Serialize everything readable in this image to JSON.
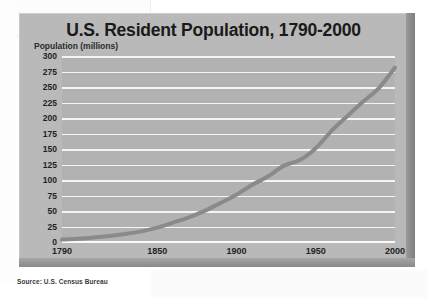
{
  "source_note": "Source: U.S. Census Bureau",
  "chart_data": {
    "type": "line",
    "title": "U.S. Resident Population, 1790-2000",
    "xlabel": "",
    "ylabel": "Population (millions)",
    "xlim": [
      1790,
      2000
    ],
    "ylim": [
      0,
      300
    ],
    "grid": true,
    "legend": "none",
    "xticks": [
      "1790",
      "1850",
      "1900",
      "1950",
      "2000"
    ],
    "xtick_values": [
      1790,
      1850,
      1900,
      1950,
      2000
    ],
    "yticks": [
      "300",
      "275",
      "250",
      "225",
      "200",
      "175",
      "150",
      "125",
      "100",
      "75",
      "50",
      "25",
      "0"
    ],
    "ytick_values": [
      300,
      275,
      250,
      225,
      200,
      175,
      150,
      125,
      100,
      75,
      50,
      25,
      0
    ],
    "x": [
      1790,
      1800,
      1810,
      1820,
      1830,
      1840,
      1850,
      1860,
      1870,
      1880,
      1890,
      1900,
      1910,
      1920,
      1930,
      1940,
      1950,
      1960,
      1970,
      1980,
      1990,
      2000
    ],
    "values": [
      3.9,
      5.3,
      7.2,
      9.6,
      12.9,
      17.1,
      23.2,
      31.4,
      39.8,
      50.2,
      62.9,
      76.2,
      92.2,
      106.0,
      123.2,
      132.2,
      151.3,
      179.3,
      203.3,
      226.5,
      248.7,
      281.4
    ],
    "series_color": "#8a8a8a",
    "gridline_color": "#f4f4f4",
    "plot_background": "#b2b2b2",
    "panel_background": "#b9b9b9"
  }
}
